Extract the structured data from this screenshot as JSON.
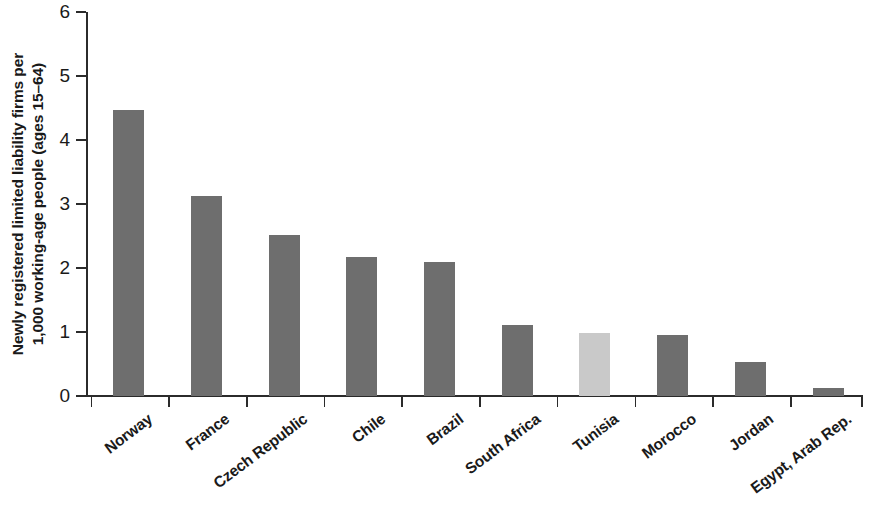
{
  "chart_data": {
    "type": "bar",
    "title": "",
    "subtitle": "",
    "xlabel": "",
    "ylabel": "Newly registered limited liability firms per\n1,000 working-age people (ages 15–64)",
    "ylim": [
      0,
      6
    ],
    "ytick_labels": [
      "0",
      "1",
      "2",
      "3",
      "4",
      "5",
      "6"
    ],
    "ytick_values": [
      0,
      1,
      2,
      3,
      4,
      5,
      6
    ],
    "grid": false,
    "legend": null,
    "categories": [
      "Norway",
      "France",
      "Czech Republic",
      "Chile",
      "Brazil",
      "South Africa",
      "Tunisia",
      "Morocco",
      "Jordan",
      "Egypt, Arab Rep."
    ],
    "values": [
      4.47,
      3.13,
      2.51,
      2.17,
      2.09,
      1.11,
      0.98,
      0.95,
      0.53,
      0.13
    ],
    "bar_colors": [
      "#6e6e6e",
      "#6e6e6e",
      "#6e6e6e",
      "#6e6e6e",
      "#6e6e6e",
      "#6e6e6e",
      "#c9c9c9",
      "#6e6e6e",
      "#6e6e6e",
      "#6e6e6e"
    ],
    "highlighted_category": "Tunisia",
    "axis_color": "#2b2b2b",
    "background": "#ffffff"
  }
}
